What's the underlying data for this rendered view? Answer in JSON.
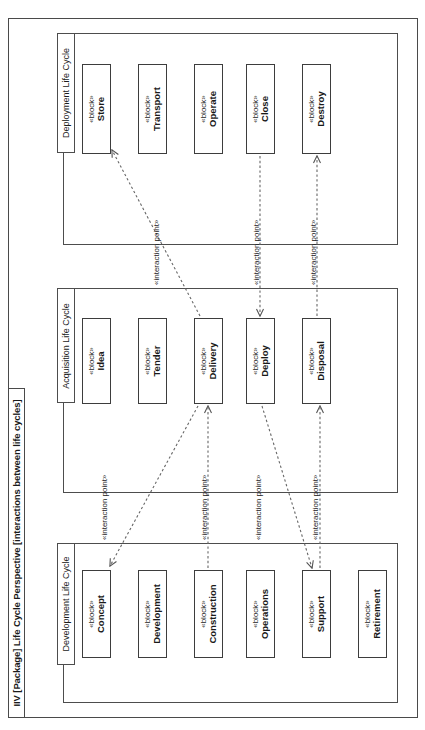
{
  "diagram": {
    "kind": "IIV",
    "title": "[Package] Life Cycle Perspective [interactions between life cycles]",
    "full_title": "IIV [Package] Life Cycle Perspective [interactions between life cycles]",
    "orientation": "rotated-90-ccw",
    "notation": "SysML block definition / package diagram"
  },
  "colors": {
    "background": "#ffffff",
    "frame_stroke": "#4a4a4a",
    "package_stroke": "#4d4d4d",
    "block_stroke": "#3d3d3d",
    "connector_stroke": "#555555",
    "text": "#1a1a1a"
  },
  "stereotypes": {
    "block": "«block»",
    "interaction_point": "«interaction point»"
  },
  "packages": [
    {
      "id": "deployment",
      "label": "Deployment Life Cycle",
      "blocks": [
        {
          "id": "store",
          "stereotype": "«block»",
          "name": "Store"
        },
        {
          "id": "transport",
          "stereotype": "«block»",
          "name": "Transport"
        },
        {
          "id": "operate",
          "stereotype": "«block»",
          "name": "Operate"
        },
        {
          "id": "close",
          "stereotype": "«block»",
          "name": "Close"
        },
        {
          "id": "destroy",
          "stereotype": "«block»",
          "name": "Destroy"
        }
      ]
    },
    {
      "id": "acquisition",
      "label": "Acquisition Life Cycle",
      "blocks": [
        {
          "id": "idea",
          "stereotype": "«block»",
          "name": "Idea"
        },
        {
          "id": "tender",
          "stereotype": "«block»",
          "name": "Tender"
        },
        {
          "id": "delivery",
          "stereotype": "«block»",
          "name": "Delivery"
        },
        {
          "id": "deploy",
          "stereotype": "«block»",
          "name": "Deploy"
        },
        {
          "id": "disposal",
          "stereotype": "«block»",
          "name": "Disposal"
        }
      ]
    },
    {
      "id": "development",
      "label": "Development Life Cycle",
      "blocks": [
        {
          "id": "concept",
          "stereotype": "«block»",
          "name": "Concept"
        },
        {
          "id": "development",
          "stereotype": "«block»",
          "name": "Development"
        },
        {
          "id": "construction",
          "stereotype": "«block»",
          "name": "Construction"
        },
        {
          "id": "operations",
          "stereotype": "«block»",
          "name": "Operations"
        },
        {
          "id": "retirement",
          "stereotype": "«block»",
          "name": "Retirement"
        }
      ]
    }
  ],
  "connectors": [
    {
      "id": "c1",
      "label": "«interaction point»",
      "from": "delivery",
      "to": "store"
    },
    {
      "id": "c2",
      "label": "«interaction point»",
      "from": "delivery",
      "to": "concept"
    },
    {
      "id": "c3",
      "label": "«interaction point»",
      "from": "construction",
      "to": "delivery"
    },
    {
      "id": "c4",
      "label": "«interaction point»",
      "from": "close",
      "to": "deploy"
    },
    {
      "id": "c5",
      "label": "«interaction point»",
      "from": "deploy",
      "to": "support"
    },
    {
      "id": "c6",
      "label": "«interaction point»",
      "from": "support",
      "to": "disposal"
    },
    {
      "id": "c7",
      "label": "«interaction point»",
      "from": "disposal",
      "to": "destroy"
    }
  ]
}
